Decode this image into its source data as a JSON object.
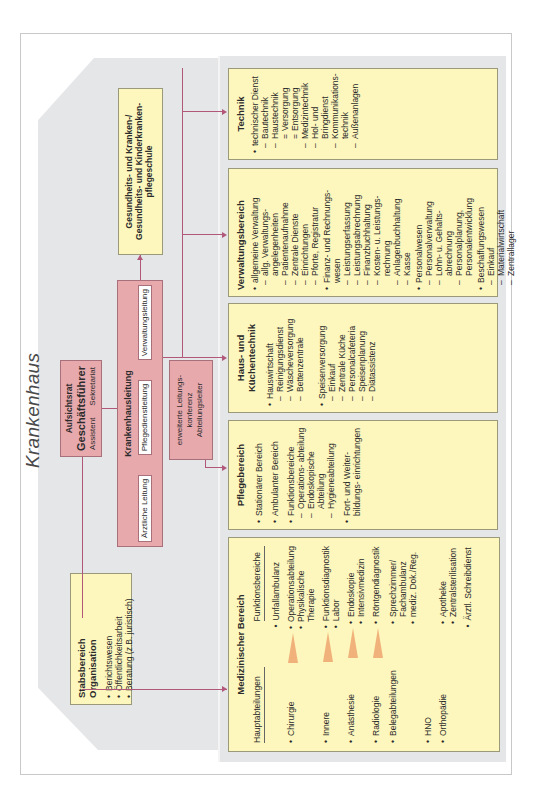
{
  "title": "Krankenhaus",
  "leadership": {
    "aufsichtsrat": "Aufsichtsrat",
    "geschaeftsfuehrer": "Geschäftsführer",
    "assistent": "Assistent",
    "sekretariat": "Sekretariat",
    "krankenhausleitung": "Krankenhausleitung",
    "leitungen": [
      "Ärztliche Leitung",
      "Pflegedienstleitung",
      "Verwaltungsleitung"
    ],
    "konferenz": [
      "erweiterte Leitungs-",
      "konferenz",
      "Abteilungsleiter"
    ]
  },
  "schule": [
    "Gesundheits- und Kranken-/",
    "Gesundheits- und Kinderkranken-",
    "pflegeschule"
  ],
  "stabsbereich": {
    "title": "Stabsbereich Organisation",
    "items": [
      "Berichtswesen",
      "Öffentlichkeitsarbeit",
      "Beratung (z.B. juristisch)"
    ]
  },
  "medizin": {
    "title": "Medizinischer Bereich",
    "col1_header": "Hauptabteilungen",
    "col2_header": "Funktionsbereiche",
    "rows": [
      {
        "left": "",
        "right": [
          "Unfallambulanz"
        ],
        "arrow": false
      },
      {
        "left": "Chirurgie",
        "right": [
          "Operationsabteilung",
          "Physikalische Therapie"
        ],
        "arrow": true
      },
      {
        "left": "Innere",
        "right": [
          "Funktionsdiagnostik",
          "Labor"
        ],
        "arrow": true
      },
      {
        "left": "Anästhesie",
        "right": [
          "Endoskopie",
          "Intensivmedizin"
        ],
        "arrow": true
      },
      {
        "left": "Radiologie",
        "right": [
          "Röntgendiagnostik"
        ],
        "arrow": true
      },
      {
        "left": "Belegabteilungen",
        "right": [
          "Sprechzimmer/ Fachambulanz",
          "mediz. Dok./Reg."
        ],
        "arrow": false
      },
      {
        "left": "HNO",
        "right": [],
        "arrow": false
      },
      {
        "left": "Orthopädie",
        "right": [
          "Apotheke",
          "Zentralsterilisation"
        ],
        "arrow": false
      },
      {
        "left": "",
        "right": [
          "Ärztl. Schreibdienst"
        ],
        "arrow": false
      }
    ]
  },
  "pflege": {
    "title": "Pflegebereich",
    "items": [
      {
        "text": "Stationärer Bereich",
        "sub": []
      },
      {
        "text": "Ambulanter Bereich",
        "sub": []
      },
      {
        "text": "Funktionsbereiche",
        "sub": [
          "Operations- abteilung",
          "Endoskopische Abteilung",
          "Hygieneabteilung"
        ]
      },
      {
        "text": "Fort- und Weiter- bildungs- einrichtungen",
        "sub": []
      }
    ]
  },
  "haus": {
    "title": "Haus- und Küchentechnik",
    "items": [
      {
        "text": "Hauswirtschaft",
        "sub": [
          "Reinigungsdienst",
          "Wäscheversorgung",
          "Bettenzentrale"
        ]
      },
      {
        "text": "Speisenversorgung",
        "sub": [
          "Einkauf",
          "Zentrale Küche",
          "Personalcafeteria",
          "Speisenplanung",
          "Diätassistenz"
        ]
      }
    ]
  },
  "verwaltung": {
    "title": "Verwaltungsbereich",
    "items": [
      {
        "text": "allgemeine Verwaltung",
        "sub": [
          "allg. Verwaltungs- angelegenheiten",
          "Patientenaufnahme",
          "Zentrale Dienste",
          "Einrichtungen",
          "Pforte, Registratur"
        ]
      },
      {
        "text": "Finanz- und Rechnungs- wesen",
        "sub": [
          "Leistungserfassung",
          "Leistungsabrechnung",
          "Finanzbuchhaltung",
          "Kosten- u. Leistungs- rechnung",
          "Anlagenbuchhaltung",
          "Kasse"
        ]
      },
      {
        "text": "Personalwesen",
        "sub": [
          "Personalverwaltung",
          "Lohn- u. Gehalts- abrechnung",
          "Personalplanung, Personalentwicklung"
        ]
      },
      {
        "text": "Beschaffungswesen",
        "sub": [
          "Einkauf",
          "Materialwirtschaft",
          "Zentrallager"
        ]
      }
    ]
  },
  "technik": {
    "title": "Technik",
    "items": [
      {
        "text": "technischer Dienst",
        "sub": [
          {
            "t": "Bautechnik",
            "lvl": 1
          },
          {
            "t": "Haustechnik",
            "lvl": 1
          },
          {
            "t": "Versorgung",
            "lvl": 2
          },
          {
            "t": "Entsorgung",
            "lvl": 2
          },
          {
            "t": "Medizintechnik",
            "lvl": 1
          },
          {
            "t": "Hol- und Bringdienst",
            "lvl": 1
          },
          {
            "t": "Kommunikations- technik",
            "lvl": 1
          },
          {
            "t": "Außenanlagen",
            "lvl": 1
          }
        ]
      }
    ]
  },
  "colors": {
    "yellow_box": "#fdf7bd",
    "pink_box": "#e8a9ad",
    "connector": "#b0577a",
    "gray_area": "#e4e6e8",
    "arrow_orange": "#f0b27a"
  }
}
